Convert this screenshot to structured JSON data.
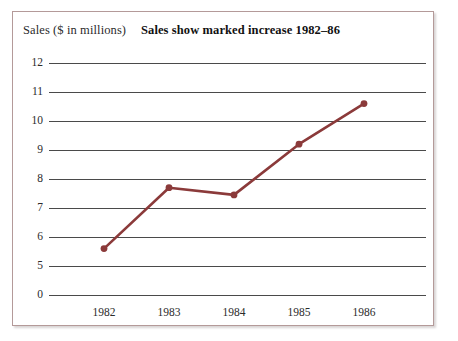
{
  "chart_data": {
    "type": "line",
    "title": "Sales show marked increase 1982–86",
    "ylabel": "Sales ($ in millions)",
    "xlabel": "",
    "categories": [
      "1982",
      "1983",
      "1984",
      "1985",
      "1986"
    ],
    "values": [
      5.6,
      7.7,
      7.45,
      9.2,
      10.6
    ],
    "series": [
      {
        "name": "Sales",
        "values": [
          5.6,
          7.7,
          7.45,
          9.2,
          10.6
        ]
      }
    ],
    "y_tick_labels": [
      "12",
      "11",
      "10",
      "9",
      "8",
      "7",
      "6",
      "5",
      "0"
    ],
    "y_tick_values": [
      12,
      11,
      10,
      9,
      8,
      7,
      6,
      5,
      0
    ],
    "axis_break": true,
    "axis_break_note": "y-axis is broken between 5 and 0",
    "ylim": [
      0,
      12
    ],
    "grid": "horizontal",
    "legend": "none",
    "line_color": "#8B3A3A",
    "marker": "circle",
    "marker_color": "#8B3A3A",
    "gridline_color": "#4a4a4a",
    "frame_color": "#b49a99",
    "background_color": "#ffffff"
  }
}
